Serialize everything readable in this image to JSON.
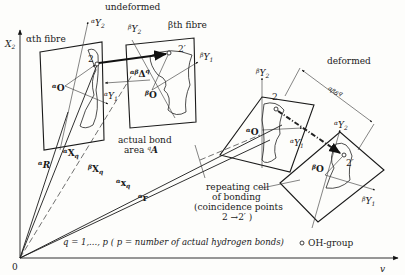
{
  "labels": {
    "undeformed": "undeformed",
    "deformed": "deformed",
    "alpha_fibre": "αth fibre",
    "beta_fibre": "βth fibre",
    "axis_x2": "X",
    "axis_x2_sub": "2",
    "axis_v": "v",
    "origin": "0",
    "bond_area_line1": "actual bond",
    "bond_area_line2": "area ",
    "bond_area_symbol": "A",
    "bond_area_pre": "q",
    "repeat_line1": "repeating  cell",
    "repeat_line2": "of bonding",
    "repeat_line3": "(coincidence points",
    "repeat_line4": "2 →2′ )",
    "q_range": "q = 1,..., p  ( p = number of actual hydrogen bonds)",
    "oh_group": "OH-group",
    "point_2": "2",
    "point_2prime": "2′",
    "vec_alpha_R": "R",
    "vec_alpha_X": "X",
    "vec_beta_X": "X",
    "vec_alpha_x": "x",
    "vec_alpha_r": "r",
    "sub_q": "q",
    "delta": "Δ",
    "delta_pre": "αβ",
    "delta_sup": "q",
    "delta_def": "αβδ",
    "delta_def_sup": "q",
    "origin_alpha": "O",
    "origin_beta": "O",
    "Y": "Y",
    "sub1": "1",
    "sub2": "2",
    "sup_alpha": "α",
    "sup_beta": "β"
  },
  "colors": {
    "ink": "#1a1a1a",
    "paper": "#fdfdfb"
  }
}
